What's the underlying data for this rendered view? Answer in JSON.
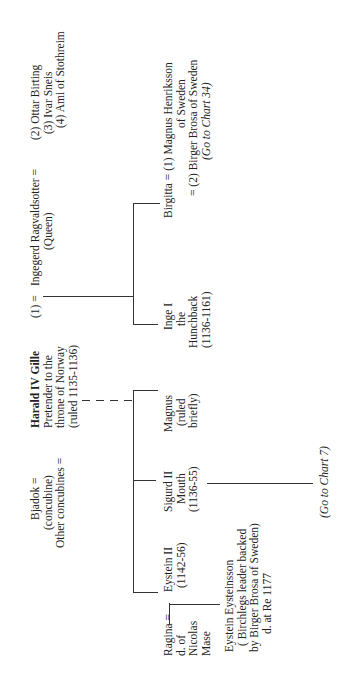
{
  "chart": {
    "orientation": "rotated-90-ccw",
    "people": {
      "harald": {
        "name": "Harald  IV Gille",
        "lines": [
          "Pretender to the",
          "throne of Norway",
          "(ruled 1135-1136)"
        ]
      },
      "bjadok": {
        "lines": [
          "Bjadok  =",
          "(concubine)",
          "Other concubines  ="
        ]
      },
      "ingegerd": {
        "prefix": "(1)  =",
        "lines": [
          "Ingegerd Ragvaldsotter  =",
          "(Queen)"
        ]
      },
      "ingegerd_spouses": {
        "lines": [
          "(2) Ottar Birting",
          "(3) Ivar Sneis",
          "(4) Ami of Stothreim"
        ]
      },
      "inge": {
        "lines": [
          "Inge I",
          "the",
          "Hunchback",
          "(1136-1161)"
        ]
      },
      "birgitta": {
        "lines": [
          "Birgitta = (1) Magnus  Henriksson",
          "of Sweden",
          "= (2) Birger Brosa of Sweden"
        ],
        "ref": "(Go to Chart 34)"
      },
      "magnus": {
        "lines": [
          "Magnus",
          "(ruled",
          "briefly)"
        ]
      },
      "sigurd": {
        "lines": [
          "Sigurd II",
          "Mouth",
          "(1136-55)"
        ],
        "ref": "(Go to Chart 7)"
      },
      "eystein": {
        "lines": [
          "Eystein II",
          "(1142-56)"
        ]
      },
      "ragina": {
        "lines": [
          "Ragina =",
          "d. of",
          "Nicolas",
          "Mase"
        ]
      },
      "eystein_eysteinsson": {
        "lines": [
          "Eystein Eysteinsson",
          "( Birchlegs leader backed",
          "by Birger Brosa of Sweden)",
          "d. at Re  1177"
        ]
      }
    }
  }
}
